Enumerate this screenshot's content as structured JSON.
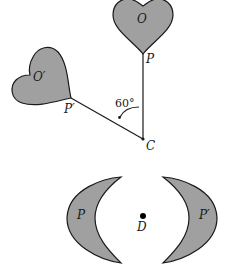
{
  "figure": {
    "top": {
      "heart_original_label": "O",
      "heart_image_label": "O′",
      "point_original_label": "P",
      "point_image_label": "P′",
      "center_label": "C",
      "angle_label": "60°"
    },
    "bottom": {
      "crescent_original_label": "P",
      "crescent_image_label": "P′",
      "center_label": "D"
    },
    "colors": {
      "fill": "#a0a0a0",
      "stroke": "#1a1a1a",
      "background": "#ffffff"
    }
  }
}
